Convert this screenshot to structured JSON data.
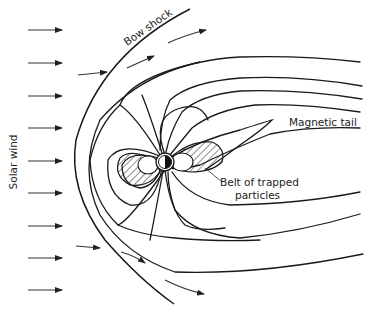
{
  "diagram": {
    "labels": {
      "solar_wind": "Solar wind",
      "bow_shock": "Bow shock",
      "magnetic_tail": "Magnetic tail",
      "belt_line1": "Belt of trapped",
      "belt_line2": "particles"
    },
    "solar_wind_arrow_count": 9,
    "colors": {
      "ink": "#1a1a1a",
      "background": "#ffffff"
    }
  }
}
